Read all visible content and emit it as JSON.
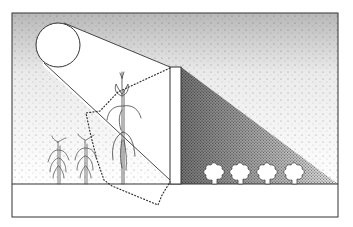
{
  "diagram": {
    "title": "",
    "elements": {
      "sun": {
        "label": "",
        "cx": 58,
        "cy": 45,
        "r": 22
      },
      "wall": {
        "label": "",
        "x": 170,
        "y": 67,
        "width": 11,
        "height": 117
      },
      "ground_line_y": 184,
      "frame": {
        "x": 12,
        "y": 13,
        "width": 326,
        "height": 204
      },
      "corn_plants": [
        {
          "name": "small-corn-1",
          "x": 58,
          "base_y": 184,
          "height": 44
        },
        {
          "name": "small-corn-2",
          "x": 85,
          "base_y": 184,
          "height": 46
        },
        {
          "name": "tall-corn",
          "x": 122,
          "base_y": 184,
          "height": 112
        }
      ],
      "bushes": [
        {
          "name": "bush-1",
          "x": 213
        },
        {
          "name": "bush-2",
          "x": 239
        },
        {
          "name": "bush-3",
          "x": 266
        },
        {
          "name": "bush-4",
          "x": 293
        }
      ],
      "shadow": {
        "points": "181,67 338,184 181,184"
      }
    },
    "colors": {
      "line": "#333333",
      "stipple": "#555555",
      "background": "#ffffff"
    }
  }
}
